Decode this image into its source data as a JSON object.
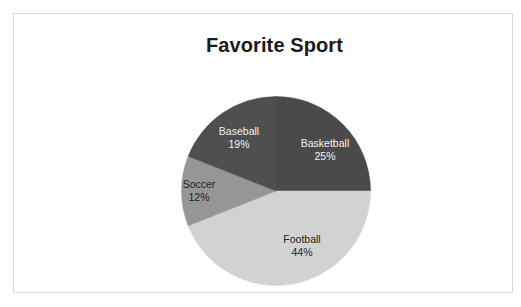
{
  "chart_data": {
    "type": "pie",
    "title": "Favorite Sport",
    "xlabel": "",
    "ylabel": "",
    "legend": "none",
    "grid": false,
    "start_angle_deg": 0,
    "direction": "clockwise",
    "categories": [
      "Basketball",
      "Football",
      "Soccer",
      "Baseball"
    ],
    "values": [
      25,
      44,
      12,
      19
    ],
    "value_unit": "percent",
    "total": 100,
    "slices": [
      {
        "label": "Basketball",
        "value": 25,
        "value_text": "25%",
        "color": "#4a4a4a",
        "label_color": "#f2f2f2",
        "start_deg": 0,
        "end_deg": 90
      },
      {
        "label": "Football",
        "value": 44,
        "value_text": "44%",
        "color": "#d2d2d2",
        "label_color": "#1f1f1f",
        "start_deg": 90,
        "end_deg": 248.4
      },
      {
        "label": "Soccer",
        "value": 12,
        "value_text": "12%",
        "color": "#969696",
        "label_color": "#1f1f1f",
        "start_deg": 248.4,
        "end_deg": 291.6
      },
      {
        "label": "Baseball",
        "value": 19,
        "value_text": "19%",
        "color": "#4f4f4f",
        "label_color": "#f2f2f2",
        "start_deg": 291.6,
        "end_deg": 360
      }
    ]
  },
  "figure": {
    "background_color": "#ffffff",
    "border_color": "#d9d9d9"
  }
}
